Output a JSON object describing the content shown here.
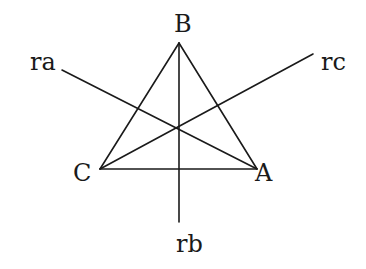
{
  "diagram": {
    "vertices": [
      {
        "name": "A",
        "x": 257,
        "y": 169
      },
      {
        "name": "B",
        "x": 179,
        "y": 43
      },
      {
        "name": "C",
        "x": 100,
        "y": 169
      }
    ],
    "lines": [
      {
        "name": "ra",
        "from": [
          62,
          70
        ],
        "to": [
          257,
          169
        ]
      },
      {
        "name": "rb",
        "from": [
          179,
          43
        ],
        "to": [
          179,
          222
        ]
      },
      {
        "name": "rc",
        "from": [
          313,
          54
        ],
        "to": [
          100,
          169
        ]
      }
    ],
    "labels": {
      "A": "A",
      "B": "B",
      "C": "C",
      "ra": "ra",
      "rb": "rb",
      "rc": "rc"
    },
    "colors": {
      "stroke": "#1a1a1a",
      "background": "#ffffff"
    }
  }
}
